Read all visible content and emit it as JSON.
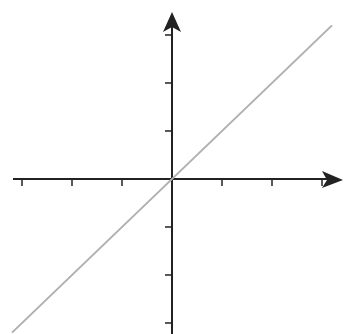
{
  "chart_data": {
    "type": "line",
    "title": "",
    "xlabel": "",
    "ylabel": "",
    "x": [
      -3,
      3
    ],
    "series": [
      {
        "name": "y = x",
        "values": [
          -3,
          3
        ]
      }
    ],
    "xlim": [
      -3,
      3
    ],
    "ylim": [
      -3,
      3
    ],
    "x_ticks": [
      -3,
      -2,
      -1,
      1,
      2,
      3
    ],
    "y_ticks": [
      -3,
      -2,
      -1,
      1,
      2,
      3
    ],
    "tick_labels_visible": false,
    "grid": false,
    "legend": "none",
    "colors": {
      "axes": "#222222",
      "line": "#b0b0b0"
    }
  }
}
